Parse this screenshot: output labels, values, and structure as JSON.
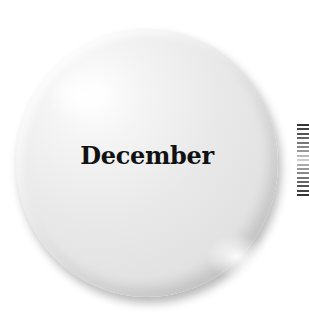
{
  "button": {
    "label": "December",
    "style": "glossy-circle",
    "color": "#e6e6e6",
    "text_color": "#111111"
  },
  "side_ticks": {
    "count": 17,
    "colors": [
      "#333333",
      "#444444",
      "#555555",
      "#666666",
      "#777777",
      "#888888",
      "#999999",
      "#bbbbbb",
      "#cccccc",
      "#aaaaaa",
      "#999999",
      "#888888",
      "#777777",
      "#666666",
      "#555555",
      "#444444",
      "#333333"
    ]
  }
}
